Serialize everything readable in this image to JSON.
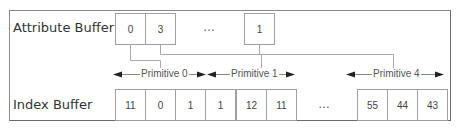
{
  "attribute_buffer": {
    "label": "Attribute Buffer",
    "cells": [
      "0",
      "3",
      "1"
    ],
    "ellipsis": "…"
  },
  "index_buffer": {
    "label": "Index Buffer",
    "cells": [
      "11",
      "0",
      "1",
      "1",
      "12",
      "11",
      "55",
      "44",
      "43"
    ],
    "ellipsis": "…"
  },
  "primitives": [
    {
      "label": "Primitive 0"
    },
    {
      "label": "Primitive 1"
    },
    {
      "label": "Primitive 4"
    }
  ],
  "colors": {
    "line": "#a0a0a0",
    "arrow": "#222222",
    "text": "#444444"
  }
}
